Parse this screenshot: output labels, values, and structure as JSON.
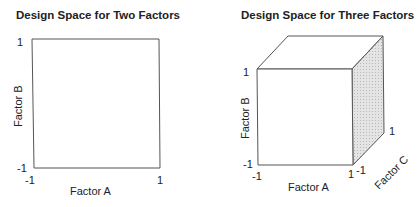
{
  "left_panel": {
    "title": "Design Space for Two Factors",
    "x_axis_label": "Factor A",
    "y_axis_label": "Factor B",
    "ticks": {
      "y_top": "1",
      "y_bottom": "-1",
      "x_left": "-1",
      "x_right": "1"
    }
  },
  "right_panel": {
    "title": "Design Space for Three Factors",
    "x_axis_label": "Factor A",
    "y_axis_label": "Factor B",
    "z_axis_label": "Factor C",
    "ticks": {
      "y_top": "1",
      "y_bottom": "-1",
      "x_left": "-1",
      "x_right": "1",
      "z_near": "-1",
      "z_far": "1"
    }
  },
  "colors": {
    "line": "#444444",
    "shade": "#d9d9d9"
  }
}
